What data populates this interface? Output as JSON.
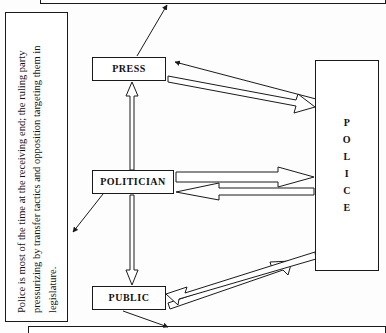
{
  "diagram": {
    "background_color": "#fdfdfd",
    "line_color": "#1a1a1a",
    "fill_color": "#ffffff",
    "nodes": [
      {
        "id": "press",
        "label": "PRESS"
      },
      {
        "id": "politician",
        "label": "POLITICIAN"
      },
      {
        "id": "public",
        "label": "PUBLIC"
      },
      {
        "id": "police",
        "label": "POLICE"
      }
    ],
    "police_letters": [
      "P",
      "O",
      "L",
      "I",
      "C",
      "E"
    ],
    "caption": {
      "text": "Police is most of the time at the receiving end; the ruling party pressurizing by transfer tactics and opposition targeting them in legislature."
    },
    "connectors": [
      {
        "id": "press-to-police",
        "from": "PRESS",
        "to": "POLICE",
        "style": "block-arrow",
        "direction": "right"
      },
      {
        "id": "police-to-press",
        "from": "POLICE",
        "to": "PRESS",
        "style": "line-arrow",
        "direction": "left"
      },
      {
        "id": "politician-to-police",
        "from": "POLITICIAN",
        "to": "POLICE",
        "style": "block-arrow",
        "direction": "right"
      },
      {
        "id": "police-to-politician",
        "from": "POLICE",
        "to": "POLITICIAN",
        "style": "block-arrow",
        "direction": "left"
      },
      {
        "id": "public-to-police",
        "from": "PUBLIC",
        "to": "POLICE",
        "style": "block-arrow",
        "direction": "right"
      },
      {
        "id": "police-to-public",
        "from": "POLICE",
        "to": "PUBLIC",
        "style": "block-arrow",
        "direction": "left"
      },
      {
        "id": "politician-to-press",
        "from": "POLITICIAN",
        "to": "PRESS",
        "style": "block-arrow",
        "direction": "up"
      },
      {
        "id": "politician-to-public",
        "from": "POLITICIAN",
        "to": "PUBLIC",
        "style": "block-arrow",
        "direction": "down"
      },
      {
        "id": "press-to-top",
        "from": "PRESS",
        "to": "TOP-BAR",
        "style": "line-arrow",
        "direction": "up-right"
      },
      {
        "id": "politician-to-caption",
        "from": "POLITICIAN",
        "to": "CAPTION",
        "style": "line-arrow",
        "direction": "down-left"
      },
      {
        "id": "public-to-bottom",
        "from": "PUBLIC",
        "to": "BOTTOM-BAR",
        "style": "line-arrow",
        "direction": "down-right"
      }
    ]
  }
}
